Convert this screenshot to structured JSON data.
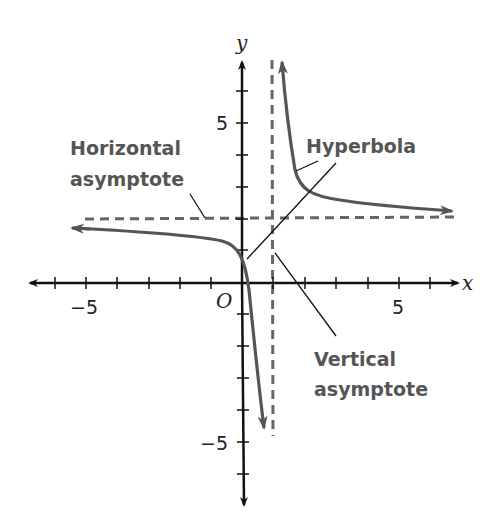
{
  "diagram": {
    "axes": {
      "x_label": "x",
      "y_label": "y",
      "origin_label": "O",
      "x_range": [
        -6.5,
        6.5
      ],
      "y_range": [
        -7,
        8
      ],
      "x_tick_labels": [
        {
          "value": -5,
          "text": "−5"
        },
        {
          "value": 5,
          "text": "5"
        }
      ],
      "y_tick_labels": [
        {
          "value": 5,
          "text": "5"
        },
        {
          "value": -5,
          "text": "−5"
        }
      ]
    },
    "curve": {
      "equation": "y = 1/(x - 1) + 2",
      "color": "#555555"
    },
    "asymptotes": {
      "vertical": {
        "x": 1
      },
      "horizontal": {
        "y": 2
      },
      "color": "#666666"
    },
    "annotations": {
      "horizontal_asymptote": {
        "line1": "Horizontal",
        "line2": "asymptote"
      },
      "hyperbola": {
        "text": "Hyperbola"
      },
      "vertical_asymptote": {
        "line1": "Vertical",
        "line2": "asymptote"
      }
    }
  }
}
